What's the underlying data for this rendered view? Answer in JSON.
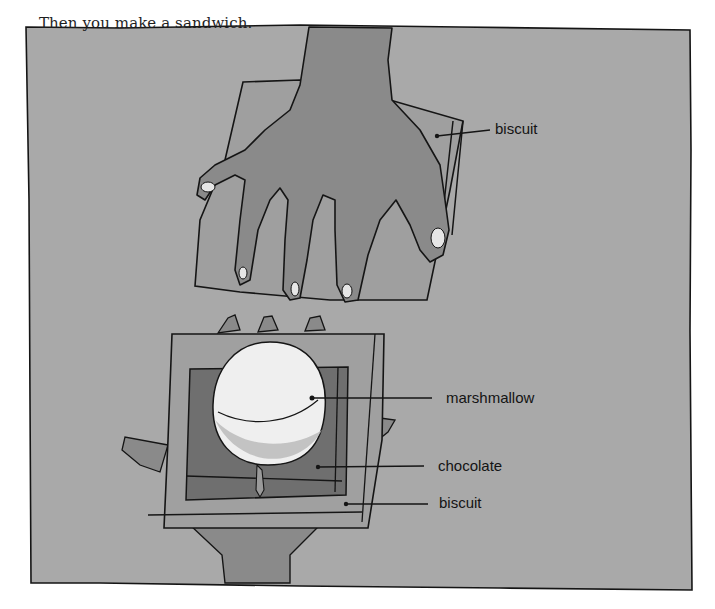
{
  "page": {
    "caption": "Then you make a sandwich.",
    "colors": {
      "paper": "#a9a9a9",
      "hand": "#8a8a8a",
      "biscuit": "#a0a0a0",
      "chocolate": "#6f6f6f",
      "marshmallow": "#f4f4f4",
      "ink": "#141414"
    }
  },
  "illustration": {
    "labels": {
      "top_biscuit": "biscuit",
      "marshmallow": "marshmallow",
      "chocolate": "chocolate",
      "bottom_biscuit": "biscuit"
    }
  }
}
